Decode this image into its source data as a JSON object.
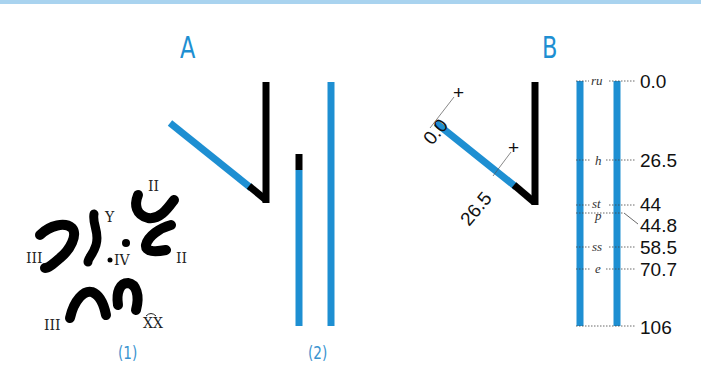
{
  "figure": {
    "top_bar_color": "#a9d3ef",
    "accent_color": "#1e8fd2",
    "chromosome_color": "#000000"
  },
  "panel_a": {
    "letter": "A",
    "karyotype": {
      "caption": "(1)",
      "labels": {
        "ii_top": "II",
        "ii_right": "II",
        "iii_left": "III",
        "iii_bottom": "III",
        "iv": "IV",
        "y": "Y",
        "xx": "XX"
      }
    },
    "chromosome_diagram": {
      "caption": "(2)"
    }
  },
  "panel_b": {
    "letter": "B",
    "map_labels": {
      "diag_start": "0.0",
      "diag_mid": "26.5",
      "plus_top": "+",
      "plus_mid": "+"
    },
    "genetic_map": {
      "markers": [
        {
          "gene": "ru",
          "position": "0.0"
        },
        {
          "gene": "h",
          "position": "26.5"
        },
        {
          "gene": "st",
          "position": "44"
        },
        {
          "gene": "p",
          "position": "44.8"
        },
        {
          "gene": "ss",
          "position": "58.5"
        },
        {
          "gene": "e",
          "position": "70.7"
        },
        {
          "gene": "",
          "position": "106"
        }
      ]
    }
  }
}
